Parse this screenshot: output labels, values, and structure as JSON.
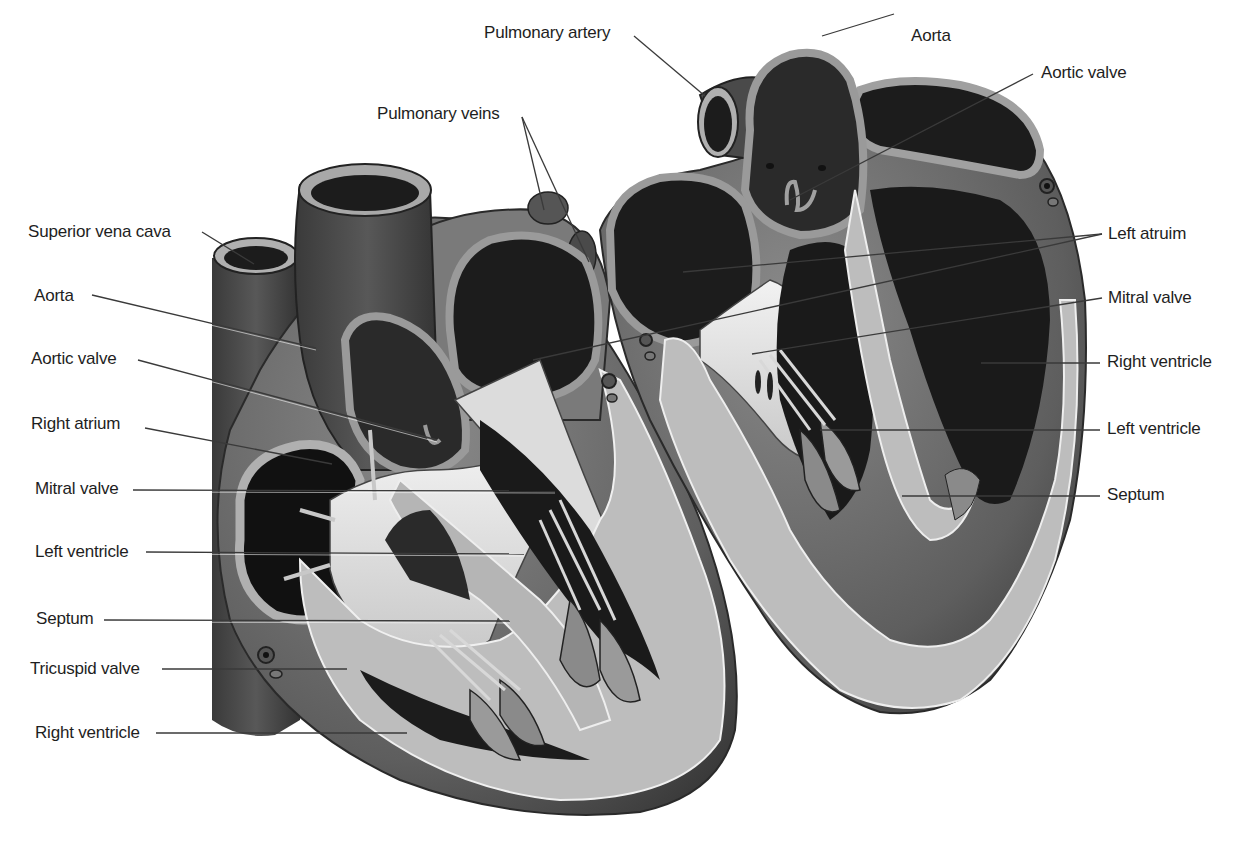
{
  "diagram": {
    "type": "anatomical-illustration",
    "views": [
      "left-view",
      "right-view"
    ]
  },
  "labels_left": [
    {
      "id": "superior-vena-cava",
      "text": "Superior vena cava"
    },
    {
      "id": "aorta",
      "text": "Aorta"
    },
    {
      "id": "aortic-valve",
      "text": "Aortic valve"
    },
    {
      "id": "right-atrium",
      "text": "Right atrium"
    },
    {
      "id": "mitral-valve",
      "text": "Mitral valve"
    },
    {
      "id": "left-ventricle",
      "text": "Left ventricle"
    },
    {
      "id": "septum",
      "text": "Septum"
    },
    {
      "id": "tricuspid-valve",
      "text": "Tricuspid valve"
    },
    {
      "id": "right-ventricle",
      "text": "Right ventricle"
    }
  ],
  "labels_top": [
    {
      "id": "pulmonary-veins",
      "text": "Pulmonary veins"
    },
    {
      "id": "pulmonary-artery",
      "text": "Pulmonary artery"
    },
    {
      "id": "aorta-top",
      "text": "Aorta"
    }
  ],
  "labels_right": [
    {
      "id": "aortic-valve-right",
      "text": "Aortic valve"
    },
    {
      "id": "left-atrium-right",
      "text": "Left atruim"
    },
    {
      "id": "mitral-valve-right",
      "text": "Mitral valve"
    },
    {
      "id": "right-ventricle-right",
      "text": "Right ventricle"
    },
    {
      "id": "left-ventricle-right",
      "text": "Left ventricle"
    },
    {
      "id": "septum-right",
      "text": "Septum"
    }
  ],
  "colors": {
    "background": "#ffffff",
    "outer_tissue": "#6e6e6e",
    "vessel_dark": "#4a4a4a",
    "chamber_dark": "#1c1c1c",
    "wall_light": "#b9b9b9",
    "valve_light": "#e8e8e8",
    "muscle_mid": "#8c8c8c",
    "leader_line": "#3a3a3a",
    "label_text": "#1e1e1e"
  }
}
